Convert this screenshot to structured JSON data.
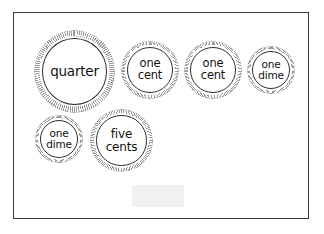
{
  "page": {
    "background_color": "#ffffff",
    "border_color": "#3a3a3a"
  },
  "coins": [
    {
      "name": "quarter",
      "label": "quarter",
      "label_lines": [
        "quarter"
      ],
      "size_class": "size-quarter",
      "x": 20,
      "y": 17,
      "edge_color": "#9a9a9a",
      "rim_color": "#2e2e2e"
    },
    {
      "name": "penny-1",
      "label": "one cent",
      "label_lines": [
        "one",
        "cent"
      ],
      "size_class": "size-penny",
      "x": 107,
      "y": 28,
      "edge_color": "#9a9a9a",
      "rim_color": "#2e2e2e"
    },
    {
      "name": "penny-2",
      "label": "one cent",
      "label_lines": [
        "one",
        "cent"
      ],
      "size_class": "size-penny",
      "x": 170,
      "y": 28,
      "edge_color": "#9a9a9a",
      "rim_color": "#2e2e2e"
    },
    {
      "name": "dime-1",
      "label": "one dime",
      "label_lines": [
        "one",
        "dime"
      ],
      "size_class": "size-dime",
      "x": 233,
      "y": 33,
      "edge_color": "#9a9a9a",
      "rim_color": "#2e2e2e"
    },
    {
      "name": "dime-2",
      "label": "one dime",
      "label_lines": [
        "one",
        "dime"
      ],
      "size_class": "size-dime",
      "x": 21,
      "y": 102,
      "edge_color": "#9a9a9a",
      "rim_color": "#2e2e2e"
    },
    {
      "name": "nickel-1",
      "label": "five cents",
      "label_lines": [
        "five",
        "cents"
      ],
      "size_class": "size-nickel",
      "x": 76,
      "y": 96,
      "edge_color": "#9a9a9a",
      "rim_color": "#2e2e2e"
    }
  ],
  "answer_box": {
    "name": "blank-answer-box",
    "value": "",
    "placeholder": "",
    "fill_color": "#f1f1f1"
  }
}
